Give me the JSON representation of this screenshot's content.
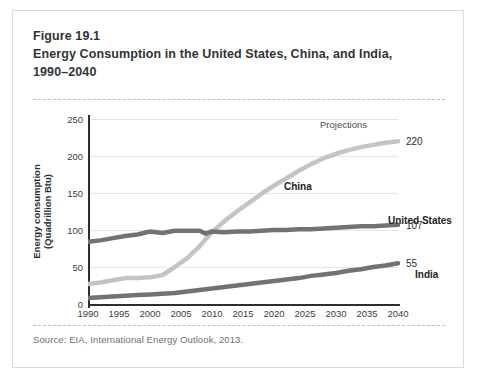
{
  "figure": {
    "number": "Figure 19.1",
    "title_line1": "Energy Consumption in the United States, China, and India,",
    "title_line2": "1990–2040",
    "source": "Source: EIA, International Energy Outlook, 2013."
  },
  "chart_data": {
    "type": "line",
    "xlabel": "",
    "ylabel": "Energy consumption (Quadrillion Btu)",
    "ylabel_line1": "Energy consumption",
    "ylabel_line2": "(Quadrillion Btu)",
    "xlim": [
      1990,
      2040
    ],
    "ylim": [
      0,
      250
    ],
    "yticks": [
      0,
      50,
      100,
      150,
      200,
      250
    ],
    "xticks": [
      1990,
      1995,
      2000,
      2005,
      2010,
      2015,
      2020,
      2025,
      2030,
      2035,
      2040
    ],
    "grid": "horizontal",
    "legend": "inline-labels",
    "annotations": [
      {
        "text": "Projections",
        "x": 2026,
        "y": 248
      }
    ],
    "x": [
      1990,
      1992,
      1994,
      1996,
      1998,
      2000,
      2002,
      2004,
      2006,
      2008,
      2009,
      2010,
      2012,
      2014,
      2016,
      2018,
      2020,
      2022,
      2024,
      2026,
      2028,
      2030,
      2032,
      2034,
      2036,
      2038,
      2040
    ],
    "series": [
      {
        "name": "China",
        "color": "#c2c4c5",
        "end_value": "220",
        "values": [
          27,
          29,
          32,
          35,
          35,
          36,
          39,
          50,
          62,
          78,
          88,
          97,
          112,
          125,
          137,
          149,
          160,
          170,
          180,
          189,
          197,
          203,
          208,
          212,
          215,
          218,
          220
        ]
      },
      {
        "name": "United States",
        "color": "#6e7476",
        "end_value": "107",
        "values": [
          84,
          86,
          89,
          92,
          94,
          98,
          96,
          99,
          99,
          99,
          95,
          98,
          97,
          98,
          98,
          99,
          100,
          100,
          101,
          101,
          102,
          103,
          104,
          105,
          105,
          106,
          107
        ]
      },
      {
        "name": "India",
        "color": "#6e7476",
        "end_value": "55",
        "values": [
          8,
          9,
          10,
          11,
          12,
          13,
          14,
          15,
          17,
          19,
          20,
          21,
          23,
          25,
          27,
          29,
          31,
          33,
          35,
          38,
          40,
          42,
          45,
          47,
          50,
          52,
          55
        ]
      }
    ]
  }
}
